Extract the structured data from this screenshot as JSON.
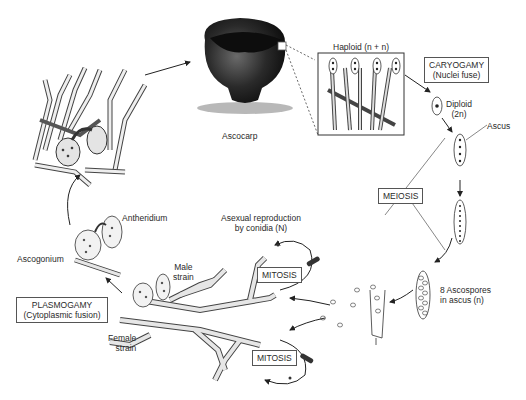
{
  "diagram": {
    "type": "life-cycle",
    "labels": {
      "ascocarp": "Ascocarp",
      "haploid": "Haploid (n + n)",
      "caryogamy_title": "CARYOGAMY",
      "caryogamy_sub": "(Nuclei fuse)",
      "diploid": "Diploid",
      "diploid_sub": "(2n)",
      "ascus": "Ascus",
      "meiosis": "MEIOSIS",
      "ascospores": "8 Ascospores",
      "ascospores_sub": "in ascus (n)",
      "asexual": "Asexual reproduction",
      "asexual_sub": "by conidia (N)",
      "mitosis_top": "MITOSIS",
      "mitosis_bottom": "MITOSIS",
      "male_strain": "Male",
      "male_strain_sub": "strain",
      "female_strain": "Female",
      "female_strain_sub": "strain",
      "antheridium": "Antheridium",
      "ascogonium": "Ascogonium",
      "plasmogamy_title": "PLASMOGAMY",
      "plasmogamy_sub": "(Cytoplasmic fusion)"
    },
    "colors": {
      "ink": "#2a2a2a",
      "ascocarp_dark": "#1e1e1e",
      "hypha_fill": "#e8e8e8"
    }
  }
}
